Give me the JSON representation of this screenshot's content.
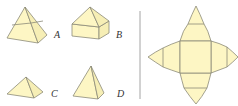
{
  "figure": {
    "options": [
      {
        "id": "A",
        "label": "A",
        "shape": "square frustum with pyramid top"
      },
      {
        "id": "B",
        "label": "B",
        "shape": "cube with square pyramid top"
      },
      {
        "id": "C",
        "label": "C",
        "shape": "short square pyramid"
      },
      {
        "id": "D",
        "label": "D",
        "shape": "tall square pyramid"
      }
    ],
    "net": {
      "description": "net: central square with four pointed petal faces, each divided by a cross line"
    },
    "colors": {
      "fill": "#fdf6c4",
      "stroke": "#8c8a78",
      "divider": "#9a9a9a"
    }
  }
}
